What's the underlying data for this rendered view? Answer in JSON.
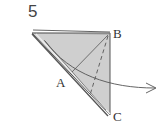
{
  "step": {
    "number": "5"
  },
  "labels": {
    "a": "A",
    "b": "B",
    "c": "C"
  },
  "colors": {
    "paper_fill": "#cfcfcf",
    "stroke": "#555555",
    "edge_highlight": "#e8e8e8"
  },
  "icons": {
    "fold_arrow": "curved-arrow-right"
  }
}
